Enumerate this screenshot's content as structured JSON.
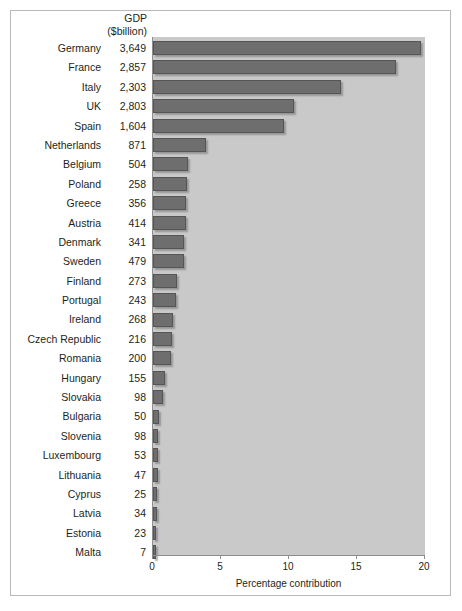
{
  "header": {
    "line1": "GDP",
    "line2": "($billion)"
  },
  "axis": {
    "title": "Percentage contribution",
    "ticks": [
      "0",
      "5",
      "10",
      "15",
      "20"
    ],
    "tick_values": [
      0,
      5,
      10,
      15,
      20
    ]
  },
  "chart_data": {
    "type": "bar",
    "orientation": "horizontal",
    "title": "",
    "xlabel": "Percentage contribution",
    "ylabel": "",
    "xlim": [
      0,
      20
    ],
    "grid": false,
    "legend": null,
    "columns": [
      "Country",
      "GDP ($billion)",
      "Percentage contribution"
    ],
    "categories": [
      "Germany",
      "France",
      "Italy",
      "UK",
      "Spain",
      "Netherlands",
      "Belgium",
      "Poland",
      "Greece",
      "Austria",
      "Denmark",
      "Sweden",
      "Finland",
      "Portugal",
      "Ireland",
      "Czech Republic",
      "Romania",
      "Hungary",
      "Slovakia",
      "Bulgaria",
      "Slovenia",
      "Luxembourg",
      "Lithuania",
      "Cyprus",
      "Latvia",
      "Estonia",
      "Malta"
    ],
    "gdp_labels": [
      "3,649",
      "2,857",
      "2,303",
      "2,803",
      "1,604",
      "871",
      "504",
      "258",
      "356",
      "414",
      "341",
      "479",
      "273",
      "243",
      "268",
      "216",
      "200",
      "155",
      "98",
      "50",
      "98",
      "53",
      "47",
      "25",
      "34",
      "23",
      "7"
    ],
    "gdp_values": [
      3649,
      2857,
      2303,
      2803,
      1604,
      871,
      504,
      258,
      356,
      414,
      341,
      479,
      273,
      243,
      268,
      216,
      200,
      155,
      98,
      50,
      98,
      53,
      47,
      25,
      34,
      23,
      7
    ],
    "values": [
      19.7,
      17.9,
      13.8,
      10.4,
      9.6,
      3.9,
      2.6,
      2.5,
      2.4,
      2.4,
      2.3,
      2.3,
      1.8,
      1.7,
      1.5,
      1.4,
      1.3,
      0.9,
      0.7,
      0.45,
      0.4,
      0.4,
      0.4,
      0.3,
      0.3,
      0.25,
      0.2
    ],
    "rows": [
      {
        "country": "Germany",
        "gdp": "3,649",
        "pct": 19.7
      },
      {
        "country": "France",
        "gdp": "2,857",
        "pct": 17.9
      },
      {
        "country": "Italy",
        "gdp": "2,303",
        "pct": 13.8
      },
      {
        "country": "UK",
        "gdp": "2,803",
        "pct": 10.4
      },
      {
        "country": "Spain",
        "gdp": "1,604",
        "pct": 9.6
      },
      {
        "country": "Netherlands",
        "gdp": "871",
        "pct": 3.9
      },
      {
        "country": "Belgium",
        "gdp": "504",
        "pct": 2.6
      },
      {
        "country": "Poland",
        "gdp": "258",
        "pct": 2.5
      },
      {
        "country": "Greece",
        "gdp": "356",
        "pct": 2.4
      },
      {
        "country": "Austria",
        "gdp": "414",
        "pct": 2.4
      },
      {
        "country": "Denmark",
        "gdp": "341",
        "pct": 2.3
      },
      {
        "country": "Sweden",
        "gdp": "479",
        "pct": 2.3
      },
      {
        "country": "Finland",
        "gdp": "273",
        "pct": 1.8
      },
      {
        "country": "Portugal",
        "gdp": "243",
        "pct": 1.7
      },
      {
        "country": "Ireland",
        "gdp": "268",
        "pct": 1.5
      },
      {
        "country": "Czech Republic",
        "gdp": "216",
        "pct": 1.4
      },
      {
        "country": "Romania",
        "gdp": "200",
        "pct": 1.3
      },
      {
        "country": "Hungary",
        "gdp": "155",
        "pct": 0.9
      },
      {
        "country": "Slovakia",
        "gdp": "98",
        "pct": 0.7
      },
      {
        "country": "Bulgaria",
        "gdp": "50",
        "pct": 0.45
      },
      {
        "country": "Slovenia",
        "gdp": "98",
        "pct": 0.4
      },
      {
        "country": "Luxembourg",
        "gdp": "53",
        "pct": 0.4
      },
      {
        "country": "Lithuania",
        "gdp": "47",
        "pct": 0.4
      },
      {
        "country": "Cyprus",
        "gdp": "25",
        "pct": 0.3
      },
      {
        "country": "Latvia",
        "gdp": "34",
        "pct": 0.3
      },
      {
        "country": "Estonia",
        "gdp": "23",
        "pct": 0.25
      },
      {
        "country": "Malta",
        "gdp": "7",
        "pct": 0.2
      }
    ]
  },
  "colors": {
    "bar_fill": "#6e6e6e",
    "bar_edge": "#555555",
    "plot_background": "#c9c9c9",
    "axis": "#8d8d8d",
    "text": "#231f20",
    "frame": "#b9b9b9"
  }
}
